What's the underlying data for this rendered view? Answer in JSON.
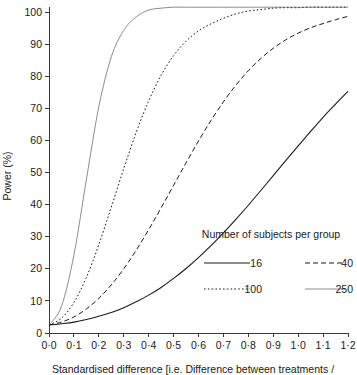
{
  "chart_data": {
    "type": "line",
    "title": "",
    "xlabel": "Standardised difference [i.e. Difference between treatments /",
    "ylabel": "Power (%)",
    "xlim": [
      0.0,
      1.2
    ],
    "ylim": [
      0,
      102
    ],
    "grid": false,
    "legend_position": "inside-lower-right",
    "legend_title": "Number of subjects per group",
    "xticks": [
      "0·0",
      "0·1",
      "0·2",
      "0·3",
      "0·4",
      "0·5",
      "0·6",
      "0·7",
      "0·8",
      "0·9",
      "1·0",
      "1·1",
      "1·2"
    ],
    "xtick_values": [
      0.0,
      0.1,
      0.2,
      0.3,
      0.4,
      0.5,
      0.6,
      0.7,
      0.8,
      0.9,
      1.0,
      1.1,
      1.2
    ],
    "yticks": [
      "0",
      "10",
      "20",
      "30",
      "40",
      "50",
      "60",
      "70",
      "80",
      "90",
      "100"
    ],
    "ytick_values": [
      0,
      10,
      20,
      30,
      40,
      50,
      60,
      70,
      80,
      90,
      100
    ],
    "x": [
      0.0,
      0.05,
      0.1,
      0.15,
      0.2,
      0.25,
      0.3,
      0.35,
      0.4,
      0.45,
      0.5,
      0.55,
      0.6,
      0.65,
      0.7,
      0.75,
      0.8,
      0.85,
      0.9,
      0.95,
      1.0,
      1.05,
      1.1,
      1.15,
      1.2
    ],
    "series": [
      {
        "name": "16",
        "label": "16",
        "style": "solid",
        "color": "#1a1a1a",
        "width": 1.1,
        "dash": "",
        "values": [
          2.5,
          2.9,
          3.4,
          4.2,
          5.2,
          6.4,
          7.9,
          9.7,
          11.8,
          14.2,
          17.0,
          20.1,
          23.5,
          27.2,
          31.2,
          35.4,
          39.8,
          44.4,
          49.0,
          53.7,
          58.3,
          62.8,
          67.2,
          71.3,
          75.3
        ]
      },
      {
        "name": "40",
        "label": "40",
        "style": "dashed",
        "color": "#1a1a1a",
        "width": 1.0,
        "dash": "5,3",
        "values": [
          2.5,
          3.4,
          5.0,
          7.5,
          10.8,
          15.0,
          20.0,
          25.8,
          32.2,
          39.0,
          46.0,
          53.0,
          59.8,
          66.2,
          72.0,
          77.2,
          81.7,
          85.5,
          88.7,
          91.3,
          93.4,
          95.1,
          96.4,
          97.4,
          98.1
        ]
      },
      {
        "name": "100",
        "label": "100",
        "style": "dotted",
        "color": "#1a1a1a",
        "width": 1.0,
        "dash": "1.6,2.2",
        "values": [
          2.5,
          4.6,
          9.5,
          17.3,
          27.5,
          39.2,
          51.2,
          62.5,
          72.3,
          80.3,
          86.4,
          90.9,
          94.1,
          96.3,
          97.7,
          98.6,
          99.2,
          99.5,
          99.8,
          99.9,
          99.9,
          100.0,
          100.0,
          100.0,
          100.0
        ]
      },
      {
        "name": "250",
        "label": "250",
        "style": "thin-solid",
        "color": "#5a5a5a",
        "width": 0.7,
        "dash": "",
        "values": [
          2.5,
          8.3,
          24.3,
          47.8,
          70.5,
          86.0,
          94.3,
          98.0,
          99.4,
          99.8,
          100.0,
          100.0,
          100.0,
          100.0,
          100.0,
          100.0,
          100.0,
          100.0,
          100.0,
          100.0,
          100.0,
          100.0,
          100.0,
          100.0,
          100.0
        ]
      }
    ],
    "plateau_value": 101.5,
    "axis_color": "#3a3a3a"
  },
  "legend": {
    "title": "Number of subjects per group",
    "entries": [
      {
        "label": "16",
        "style": "solid"
      },
      {
        "label": "40",
        "style": "dashed"
      },
      {
        "label": "100",
        "style": "dotted"
      },
      {
        "label": "250",
        "style": "thin-solid"
      }
    ]
  }
}
